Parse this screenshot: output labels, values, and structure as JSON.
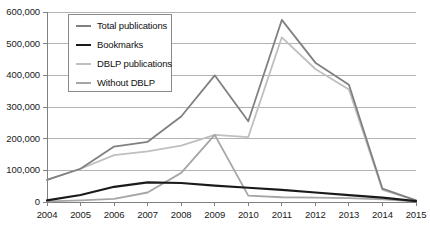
{
  "chart_data": {
    "type": "line",
    "title": "",
    "xlabel": "",
    "ylabel": "",
    "categories": [
      "2004",
      "2005",
      "2006",
      "2007",
      "2008",
      "2009",
      "2010",
      "2011",
      "2012",
      "2013",
      "2014",
      "2015"
    ],
    "x": [
      2004,
      2005,
      2006,
      2007,
      2008,
      2009,
      2010,
      2011,
      2012,
      2013,
      2014,
      2015
    ],
    "ylim": [
      0,
      600000
    ],
    "xlim": [
      2004,
      2015
    ],
    "grid": "horizontal",
    "legend_position": "upper-left-inside",
    "ytick_labels": [
      "600,000",
      "500,000",
      "400,000",
      "300,000",
      "200,000",
      "100,000",
      "0"
    ],
    "ytick_values": [
      600000,
      500000,
      400000,
      300000,
      200000,
      100000,
      0
    ],
    "series": [
      {
        "name": "Total publications",
        "color": "#808080",
        "width": 1.8,
        "values": [
          70000,
          105000,
          175000,
          190000,
          270000,
          400000,
          255000,
          575000,
          440000,
          370000,
          42000,
          5000
        ]
      },
      {
        "name": "Bookmarks",
        "color": "#1a1a1a",
        "width": 2.2,
        "values": [
          5000,
          22000,
          48000,
          62000,
          60000,
          52000,
          45000,
          38000,
          30000,
          22000,
          14000,
          3000
        ]
      },
      {
        "name": "DBLP publications",
        "color": "#bfbfbf",
        "width": 1.8,
        "values": [
          70000,
          105000,
          148000,
          160000,
          178000,
          212000,
          205000,
          520000,
          420000,
          355000,
          38000,
          5000
        ]
      },
      {
        "name": "Without DBLP",
        "color": "#a6a6a6",
        "width": 1.8,
        "values": [
          2000,
          5000,
          10000,
          30000,
          92000,
          212000,
          20000,
          15000,
          14000,
          12000,
          8000,
          2000
        ]
      }
    ]
  },
  "axis": {
    "y_name": "publication-count-axis",
    "x_name": "year-axis"
  }
}
